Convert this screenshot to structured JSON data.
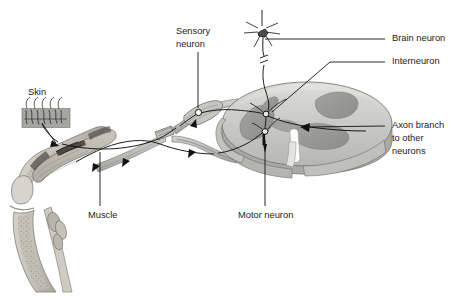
{
  "figure": {
    "background_color": "#ffffff",
    "ink_color": "#1a1a1a"
  },
  "labels": {
    "sensory_neuron_line1": "Sensory",
    "sensory_neuron_line2": "neuron",
    "brain_neuron": "Brain neuron",
    "interneuron": "Interneuron",
    "axon_branch_line1": "Axon branch",
    "axon_branch_line2": "to other",
    "axon_branch_line3": "neurons",
    "skin": "Skin",
    "muscle": "Muscle",
    "motor_neuron": "Motor neuron"
  },
  "colors": {
    "white_matter": "#c9c9c5",
    "white_matter_light": "#d9d9d5",
    "gray_matter": "#989894",
    "gray_matter_dark": "#8a8a86",
    "bone_fill": "#c5c0b8",
    "bone_marrow": "#b4ada3",
    "muscle_fill": "#bdb8b0",
    "nerve_fill": "#b9b9b5",
    "skin_fill": "#a8a8a4",
    "outline": "#6f6f6b",
    "leader_line": "#111111"
  },
  "structures": [
    {
      "name": "skin-patch",
      "description": "Hatched skin block with hairs and free nerve endings"
    },
    {
      "name": "limb",
      "description": "Bent limb cross-section with bones, joint and muscle"
    },
    {
      "name": "nerve-bundle",
      "description": "Peripheral nerve running from limb to spinal cord"
    },
    {
      "name": "dorsal-root-ganglion",
      "description": "Swelling on dorsal root containing sensory neuron cell body"
    },
    {
      "name": "spinal-cord",
      "description": "Spinal cord cross-section with butterfly gray matter"
    },
    {
      "name": "brain-neuron",
      "description": "Descending neuron from brain with star-shaped soma"
    },
    {
      "name": "interneuron",
      "description": "Interneuron cell body in dorsal gray matter"
    },
    {
      "name": "motor-neuron",
      "description": "Motor neuron cell body in ventral horn"
    },
    {
      "name": "axon-branch",
      "description": "Axon branch extending to other neurons"
    }
  ],
  "flow_arrows": [
    {
      "name": "skin-to-nerve",
      "direction": "down-right"
    },
    {
      "name": "sensory-afferent",
      "direction": "up-right"
    },
    {
      "name": "motor-efferent",
      "direction": "down-left"
    },
    {
      "name": "axon-branch-arrow",
      "direction": "left"
    },
    {
      "name": "motor-neuron-arrow",
      "direction": "down"
    }
  ]
}
